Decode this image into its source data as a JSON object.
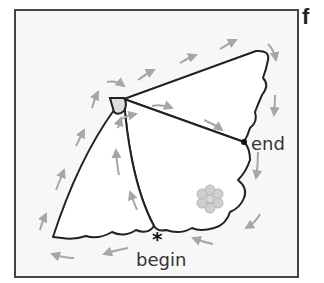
{
  "panel": {
    "label": "f"
  },
  "diagram": {
    "labels": {
      "begin": "begin",
      "end": "end"
    },
    "markers": {
      "begin_marker": "*",
      "end_marker": "dot"
    },
    "icons": [
      "flower-icon",
      "arrow-icon"
    ],
    "colors": {
      "outline": "#222222",
      "arrow": "#a6a6a6",
      "flower": "#c8c8c8",
      "frame": "#444444",
      "frame_fill": "#f7f7f7",
      "hub_fill": "#dddddd"
    }
  }
}
